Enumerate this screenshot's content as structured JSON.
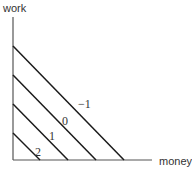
{
  "diagram": {
    "type": "indifference-curves",
    "y_axis_label": "work",
    "x_axis_label": "money",
    "curves": [
      {
        "label": "2",
        "y_intercept_px": 133,
        "x_intercept_px": 40
      },
      {
        "label": "1",
        "y_intercept_px": 104,
        "x_intercept_px": 68
      },
      {
        "label": "0",
        "y_intercept_px": 75,
        "x_intercept_px": 96
      },
      {
        "label": "−1",
        "y_intercept_px": 46,
        "x_intercept_px": 124
      }
    ],
    "colors": {
      "axis": "#555555",
      "curve": "#1a1a1a",
      "text": "#333333",
      "background": "#ffffff"
    }
  }
}
